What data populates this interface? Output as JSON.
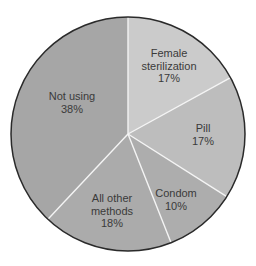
{
  "chart_data": {
    "type": "pie",
    "title": "",
    "start_angle_deg": 0,
    "direction": "clockwise",
    "center": [
      128,
      134
    ],
    "radius": 117,
    "outline_color": "#2a2a2a",
    "divider_color": "#f4f4f4",
    "slices": [
      {
        "label": "Female sterilization",
        "value": 17,
        "display": "17%",
        "color": "#cbcbcb",
        "label_lines": [
          "Female",
          "sterilization",
          "17%"
        ],
        "label_pos": [
          169,
          57
        ]
      },
      {
        "label": "Pill",
        "value": 17,
        "display": "17%",
        "color": "#bdbdbd",
        "label_lines": [
          "Pill",
          "17%"
        ],
        "label_pos": [
          203,
          132
        ]
      },
      {
        "label": "Condom",
        "value": 10,
        "display": "10%",
        "color": "#adadad",
        "label_lines": [
          "Condom",
          "10%"
        ],
        "label_pos": [
          176,
          197
        ]
      },
      {
        "label": "All other methods",
        "value": 18,
        "display": "18%",
        "color": "#ababab",
        "label_lines": [
          "All other",
          "methods",
          "18%"
        ],
        "label_pos": [
          112,
          202
        ]
      },
      {
        "label": "Not using",
        "value": 38,
        "display": "38%",
        "color": "#a6a6a6",
        "label_lines": [
          "Not using",
          "38%"
        ],
        "label_pos": [
          72,
          100
        ]
      }
    ]
  }
}
